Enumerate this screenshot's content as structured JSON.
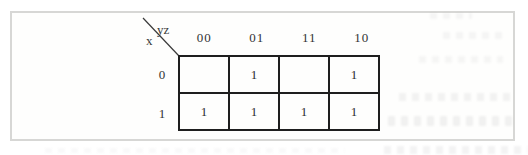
{
  "figure": {
    "type": "karnaugh-map",
    "corner": {
      "top_label": "yz",
      "side_label": "x"
    },
    "col_headers": [
      "00",
      "01",
      "11",
      "10"
    ],
    "row_headers": [
      "0",
      "1"
    ],
    "cells": [
      [
        "",
        "1",
        "",
        "1"
      ],
      [
        "1",
        "1",
        "1",
        "1"
      ]
    ]
  },
  "colors": {
    "table_border": "#1e1e1e",
    "frame_border": "#d7d7d5",
    "text": "#333333"
  }
}
